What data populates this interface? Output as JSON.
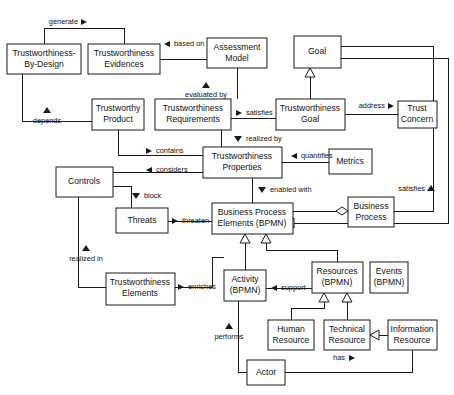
{
  "diagram": {
    "type": "uml-class-diagram",
    "width": 454,
    "height": 395,
    "background_color": "#ffffff",
    "line_color": "#1a1a1a",
    "box_fill": "#ffffff",
    "nodes": [
      {
        "id": "tbd",
        "label": "Trustworthiness-\nBy-Design",
        "x": 7,
        "y": 44,
        "w": 74,
        "h": 30
      },
      {
        "id": "tevid",
        "label": "Trustworthiness\nEvidences",
        "x": 88,
        "y": 44,
        "w": 72,
        "h": 30
      },
      {
        "id": "amodel",
        "label": "Assessment\nModel",
        "x": 207,
        "y": 38,
        "w": 60,
        "h": 30
      },
      {
        "id": "goal",
        "label": "Goal",
        "x": 294,
        "y": 36,
        "w": 47,
        "h": 32
      },
      {
        "id": "tprod",
        "label": "Trustworthy\nProduct",
        "x": 92,
        "y": 99,
        "w": 52,
        "h": 31
      },
      {
        "id": "treq",
        "label": "Trustworthiness\nRequirements",
        "x": 155,
        "y": 99,
        "w": 76,
        "h": 31
      },
      {
        "id": "tgoal",
        "label": "Trustworthiness\nGoal",
        "x": 276,
        "y": 99,
        "w": 69,
        "h": 31
      },
      {
        "id": "tconcern",
        "label": "Trust\nConcern",
        "x": 398,
        "y": 101,
        "w": 39,
        "h": 27
      },
      {
        "id": "tprops",
        "label": "Trustworthiness\nProperties",
        "x": 203,
        "y": 147,
        "w": 79,
        "h": 31
      },
      {
        "id": "metrics",
        "label": "Metrics",
        "x": 329,
        "y": 149,
        "w": 43,
        "h": 25
      },
      {
        "id": "controls",
        "label": "Controls",
        "x": 56,
        "y": 167,
        "w": 57,
        "h": 30
      },
      {
        "id": "threats",
        "label": "Threats",
        "x": 116,
        "y": 208,
        "w": 52,
        "h": 25
      },
      {
        "id": "bpe",
        "label": "Business Process\nElements (BPMN)",
        "x": 212,
        "y": 203,
        "w": 81,
        "h": 31
      },
      {
        "id": "bproc",
        "label": "Business\nProcess",
        "x": 348,
        "y": 197,
        "w": 46,
        "h": 30
      },
      {
        "id": "telem",
        "label": "Trustworthiness\nElements",
        "x": 106,
        "y": 273,
        "w": 69,
        "h": 32
      },
      {
        "id": "activity",
        "label": "Activity\n(BPMN)",
        "x": 224,
        "y": 270,
        "w": 42,
        "h": 31
      },
      {
        "id": "resources",
        "label": "Resources\n(BPMN)",
        "x": 312,
        "y": 262,
        "w": 51,
        "h": 31
      },
      {
        "id": "events",
        "label": "Events\n(BPMN)",
        "x": 370,
        "y": 262,
        "w": 38,
        "h": 31
      },
      {
        "id": "hres",
        "label": "Human\nResource",
        "x": 268,
        "y": 320,
        "w": 46,
        "h": 30
      },
      {
        "id": "tres",
        "label": "Technical\nResource",
        "x": 324,
        "y": 320,
        "w": 46,
        "h": 30
      },
      {
        "id": "ires",
        "label": "Information\nResource",
        "x": 388,
        "y": 320,
        "w": 49,
        "h": 30
      },
      {
        "id": "actor",
        "label": "Actor",
        "x": 247,
        "y": 360,
        "w": 38,
        "h": 25
      }
    ],
    "edge_labels": [
      {
        "id": "generate",
        "text": "generate",
        "marker": "right",
        "x": 82,
        "y": 22
      },
      {
        "id": "based-on",
        "text": "based on",
        "marker": "left",
        "x": 166,
        "y": 41
      },
      {
        "id": "evaluated-by",
        "text": "evaluated by",
        "marker": "up",
        "x": 206,
        "y": 87
      },
      {
        "id": "depends",
        "text": "depends",
        "marker": "up",
        "x": 39,
        "y": 120
      },
      {
        "id": "satisfies",
        "text": "satisfies",
        "marker": "right",
        "x": 246,
        "y": 103
      },
      {
        "id": "address",
        "text": "address",
        "marker": "right",
        "x": 365,
        "y": 101
      },
      {
        "id": "realized-by",
        "text": "realized by",
        "marker": "down",
        "x": 261,
        "y": 138
      },
      {
        "id": "contains",
        "text": "contains",
        "marker": "right",
        "x": 160,
        "y": 152
      },
      {
        "id": "considers",
        "text": "considers",
        "marker": "left",
        "x": 160,
        "y": 170
      },
      {
        "id": "quantifies",
        "text": "quantifies",
        "marker": "left",
        "x": 305,
        "y": 156
      },
      {
        "id": "satisfies-2",
        "text": "satisfies",
        "marker": "up",
        "x": 420,
        "y": 186
      },
      {
        "id": "block",
        "text": "block",
        "marker": "down",
        "x": 142,
        "y": 197
      },
      {
        "id": "enabled-with",
        "text": "enabled with",
        "marker": "down",
        "x": 265,
        "y": 190
      },
      {
        "id": "threaten",
        "text": "threaten",
        "marker": "right",
        "x": 190,
        "y": 219
      },
      {
        "id": "realized-in",
        "text": "realized in",
        "marker": "up",
        "x": 100,
        "y": 258
      },
      {
        "id": "enriches",
        "text": "enriches",
        "marker": "right",
        "x": 194,
        "y": 288
      },
      {
        "id": "support",
        "text": "support",
        "marker": "left",
        "x": 289,
        "y": 288
      },
      {
        "id": "performs",
        "text": "performs",
        "marker": "up",
        "x": 229,
        "y": 335
      },
      {
        "id": "has",
        "text": "has",
        "marker": "right",
        "x": 343,
        "y": 356
      }
    ],
    "relationships": [
      {
        "from": "tbd",
        "to": "tevid",
        "label": "generate",
        "kind": "association"
      },
      {
        "from": "amodel",
        "to": "tevid",
        "label": "based on",
        "kind": "association"
      },
      {
        "from": "treq",
        "to": "amodel",
        "label": "evaluated by",
        "kind": "association"
      },
      {
        "from": "tprod",
        "to": "tbd",
        "label": "depends",
        "kind": "association"
      },
      {
        "from": "treq",
        "to": "tgoal",
        "label": "satisfies",
        "kind": "association"
      },
      {
        "from": "tgoal",
        "to": "tconcern",
        "label": "address",
        "kind": "association"
      },
      {
        "from": "tgoal",
        "to": "goal",
        "label": "",
        "kind": "generalization"
      },
      {
        "from": "treq",
        "to": "tprops",
        "label": "realized by",
        "kind": "association"
      },
      {
        "from": "tprod",
        "to": "tprops",
        "label": "contains",
        "kind": "association"
      },
      {
        "from": "controls",
        "to": "tprops",
        "label": "considers",
        "kind": "association"
      },
      {
        "from": "metrics",
        "to": "tprops",
        "label": "quantifies",
        "kind": "association"
      },
      {
        "from": "tprops",
        "to": "bpe",
        "label": "enabled with",
        "kind": "association"
      },
      {
        "from": "controls",
        "to": "threats",
        "label": "block",
        "kind": "association"
      },
      {
        "from": "threats",
        "to": "bpe",
        "label": "threaten",
        "kind": "association"
      },
      {
        "from": "controls",
        "to": "telem",
        "label": "realized in",
        "kind": "association"
      },
      {
        "from": "telem",
        "to": "activity",
        "label": "enriches",
        "kind": "association"
      },
      {
        "from": "bproc",
        "to": "bpe",
        "label": "",
        "kind": "aggregation"
      },
      {
        "from": "bproc",
        "to": "goal",
        "label": "satisfies",
        "kind": "association"
      },
      {
        "from": "activity",
        "to": "bpe",
        "label": "",
        "kind": "generalization"
      },
      {
        "from": "resources",
        "to": "bpe",
        "label": "",
        "kind": "generalization"
      },
      {
        "from": "events",
        "to": "bpe",
        "label": "",
        "kind": "generalization"
      },
      {
        "from": "resources",
        "to": "activity",
        "label": "support",
        "kind": "association"
      },
      {
        "from": "hres",
        "to": "resources",
        "label": "",
        "kind": "generalization"
      },
      {
        "from": "tres",
        "to": "resources",
        "label": "",
        "kind": "generalization"
      },
      {
        "from": "ires",
        "to": "tres",
        "label": "",
        "kind": "generalization"
      },
      {
        "from": "actor",
        "to": "activity",
        "label": "performs",
        "kind": "association"
      },
      {
        "from": "actor",
        "to": "ires",
        "label": "has",
        "kind": "association"
      }
    ]
  }
}
